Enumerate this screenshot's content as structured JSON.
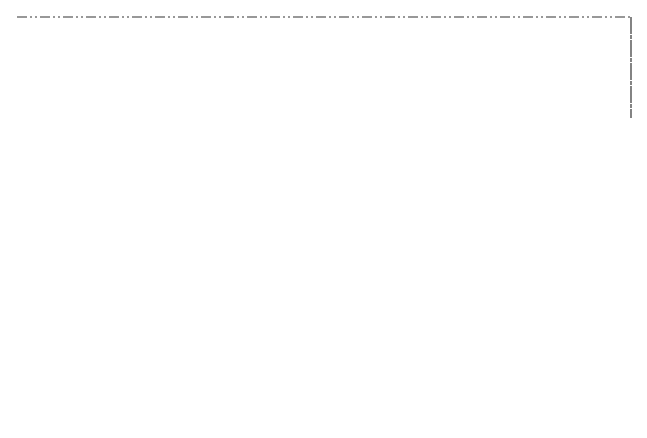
{
  "nodes": {
    "structures": "Structures",
    "quality_of_life": "Quality of life",
    "environmental_pollution": [
      "Environmental",
      "pollution"
    ],
    "other_ecosystems": "Other ecosystems",
    "solar_energy": "Solar energy",
    "human_population": "Human population",
    "social_structure": "Social structure",
    "institutional": {
      "title": "Institutional mediating factors",
      "items": [
        "1. Economic systems",
        "2. Political systems",
        "3. Technology"
      ]
    },
    "resources": {
      "title": "Resources",
      "nonliving": "Nonliving",
      "living": "Living"
    }
  },
  "legend": [
    {
      "style": "dashed",
      "label": [
        "Resource-exploitation (economic)",
        "subsystem"
      ]
    },
    {
      "style": "dash-dot",
      "label": [
        "Subsystem of prevailing",
        "environmental concern"
      ]
    },
    {
      "style": "dash-dot-dot",
      "label": [
        "Global ecosystem"
      ]
    }
  ],
  "colors": {
    "box_fill": "#d4d4d4",
    "line": "#222222"
  }
}
